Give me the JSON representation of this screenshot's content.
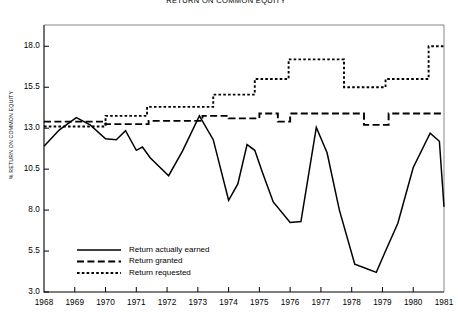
{
  "chart_data": {
    "type": "line",
    "title": "RETURN ON COMMON EQUITY",
    "xlabel": "",
    "ylabel": "% RETURN ON COMMON EQUITY",
    "xlim": [
      1968,
      1981
    ],
    "ylim": [
      3.0,
      19.3
    ],
    "grid": false,
    "legend_position": "lower-left-inside",
    "y_ticks": [
      "18.0",
      "15.5",
      "13.0",
      "10.5",
      "8.0",
      "5.5",
      "3.0"
    ],
    "y_tick_values": [
      18.0,
      15.5,
      13.0,
      10.5,
      8.0,
      5.5,
      3.0
    ],
    "x_ticks": [
      "1968",
      "1969",
      "1970",
      "1971",
      "1972",
      "1973",
      "1974",
      "1975",
      "1976",
      "1977",
      "1978",
      "1979",
      "1980",
      "1981"
    ],
    "x_tick_values": [
      1968,
      1969,
      1970,
      1971,
      1972,
      1973,
      1974,
      1975,
      1976,
      1977,
      1978,
      1979,
      1980,
      1981
    ],
    "series": [
      {
        "name": "Return actually earned",
        "style": "solid",
        "color": "#000000",
        "x": [
          1968.0,
          1968.5,
          1969.05,
          1969.5,
          1970.0,
          1970.35,
          1970.65,
          1971.0,
          1971.2,
          1971.45,
          1972.05,
          1972.5,
          1973.05,
          1973.5,
          1974.0,
          1974.3,
          1974.6,
          1974.85,
          1975.1,
          1975.45,
          1976.0,
          1976.35,
          1976.85,
          1977.2,
          1977.6,
          1978.1,
          1978.45,
          1978.8,
          1979.1,
          1979.5,
          1980.0,
          1980.55,
          1980.85,
          1981.0
        ],
        "y": [
          11.9,
          12.9,
          13.65,
          13.2,
          12.35,
          12.3,
          12.85,
          11.65,
          11.85,
          11.2,
          10.1,
          11.6,
          13.75,
          12.3,
          8.6,
          9.6,
          12.0,
          11.65,
          10.3,
          8.5,
          7.25,
          7.3,
          13.05,
          11.5,
          8.0,
          4.7,
          4.45,
          4.2,
          5.5,
          7.2,
          10.6,
          12.7,
          12.2,
          8.2
        ]
      },
      {
        "name": "Return granted",
        "style": "dashed",
        "color": "#000000",
        "step_x": [
          1968.0,
          1970.0,
          1971.4,
          1973.15,
          1974.0,
          1975.0,
          1975.6,
          1976.0,
          1977.75,
          1978.4,
          1979.2,
          1981.0
        ],
        "step_y": [
          13.4,
          13.25,
          13.45,
          13.75,
          13.6,
          13.9,
          13.4,
          13.9,
          13.9,
          13.2,
          13.9,
          13.9
        ]
      },
      {
        "name": "Return requested",
        "style": "dotted",
        "color": "#000000",
        "step_x": [
          1968.0,
          1970.0,
          1971.35,
          1973.5,
          1974.85,
          1975.95,
          1977.75,
          1979.1,
          1980.5,
          1981.0
        ],
        "step_y": [
          13.1,
          13.75,
          14.3,
          15.05,
          16.0,
          17.2,
          15.5,
          16.0,
          18.0,
          18.0
        ]
      }
    ]
  },
  "legend": {
    "items": [
      {
        "label": "Return actually earned",
        "style": "solid"
      },
      {
        "label": "Return granted",
        "style": "dashed"
      },
      {
        "label": "Return requested",
        "style": "dotted"
      }
    ]
  }
}
